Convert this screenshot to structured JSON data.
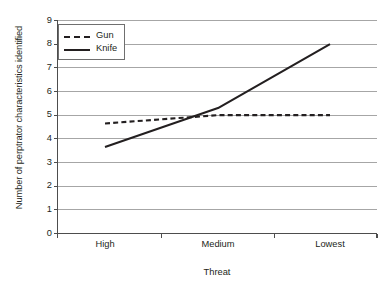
{
  "chart_data": {
    "type": "line",
    "title": "",
    "xlabel": "Threat",
    "ylabel": "Number of perptrator characteristics identified",
    "categories": [
      "High",
      "Medium",
      "Lowest"
    ],
    "series": [
      {
        "name": "Gun",
        "values": [
          4.65,
          5.0,
          5.0
        ],
        "style": "dashed"
      },
      {
        "name": "Knife",
        "values": [
          3.65,
          5.3,
          8.0
        ],
        "style": "solid"
      }
    ],
    "ylim": [
      0,
      9
    ],
    "yticks": [
      0,
      1,
      2,
      3,
      4,
      5,
      6,
      7,
      8,
      9
    ],
    "ytick_labels": [
      "0",
      "1",
      "2",
      "3",
      "4",
      "5",
      "6",
      "7",
      "8",
      "9"
    ],
    "grid": "horizontal",
    "legend_position": "top-left-inside",
    "line_color": "#231f20",
    "grid_color": "#a6a6a6",
    "axis_color": "#4d4d4d",
    "background": "#ffffff"
  }
}
